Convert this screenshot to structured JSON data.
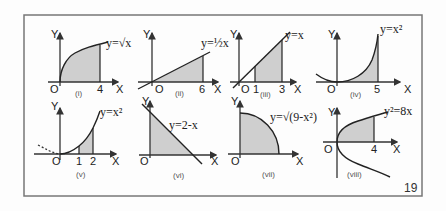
{
  "figure": {
    "page_number": "19",
    "axis_labels": {
      "x": "X",
      "y": "Y",
      "origin": "O"
    },
    "graphs": [
      {
        "id": "i",
        "caption": "(i)",
        "equation": "y=√x",
        "ticks": [
          "4"
        ],
        "shaded_region": "0 ≤ x ≤ 4 under y=√x"
      },
      {
        "id": "ii",
        "caption": "(ii)",
        "equation": "y=½x",
        "ticks": [
          "6"
        ],
        "shaded_region": "0 ≤ x ≤ 6 under y=x/2"
      },
      {
        "id": "iii",
        "caption": "(iii)",
        "equation": "y=x",
        "ticks": [
          "1",
          "3"
        ],
        "shaded_region": "1 ≤ x ≤ 3 under y=x"
      },
      {
        "id": "iv",
        "caption": "(iv)",
        "equation": "y=x²",
        "ticks": [
          "5"
        ],
        "shaded_region": "0 ≤ x ≤ 5 under y=x²"
      },
      {
        "id": "v",
        "caption": "(v)",
        "equation": "y=x²",
        "ticks": [
          "1",
          "2"
        ],
        "shaded_region": "1 ≤ x ≤ 2 under y=x²"
      },
      {
        "id": "vi",
        "caption": "(vi)",
        "equation": "y=2-x",
        "ticks": [],
        "shaded_region": "0 ≤ x ≤ 2 under y=2-x"
      },
      {
        "id": "vii",
        "caption": "(vii)",
        "equation": "y=√(9-x²)",
        "ticks": [],
        "shaded_region": "0 ≤ x ≤ 3 under y=√(9-x²)"
      },
      {
        "id": "viii",
        "caption": "(viii)",
        "equation": "y²=8x",
        "ticks": [
          "4"
        ],
        "shaded_region": "0 ≤ x ≤ 4 under upper branch of y²=8x"
      }
    ]
  }
}
